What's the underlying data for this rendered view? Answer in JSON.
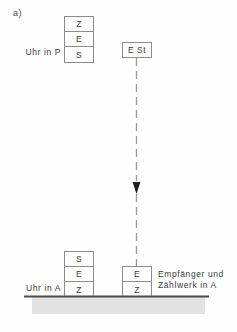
{
  "figure": {
    "panel_label": "a)",
    "colors": {
      "ink": "#3b3b3b",
      "box_stroke": "#8c8c8c",
      "ground_line": "#4a4a4a",
      "ground_fill": "#e2e2e2",
      "background": "#fefefe"
    }
  },
  "labels": {
    "clock_p": "Uhr in P",
    "clock_a": "Uhr in A",
    "receiver_line1": "Empfänger und",
    "receiver_line2": "Zählwerk in A"
  },
  "stacks": {
    "clock_p": {
      "name": "Uhr in P",
      "cells": [
        "Z",
        "E",
        "S"
      ]
    },
    "clock_a": {
      "name": "Uhr in A",
      "cells": [
        "S",
        "E",
        "Z"
      ]
    },
    "receiver_a": {
      "name": "Empfänger und Zählwerk in A",
      "cells": [
        "E",
        "Z"
      ]
    }
  },
  "signal_box": {
    "label": "E St"
  },
  "signal_path": {
    "direction": "downward",
    "style": "dashed",
    "from_label": "E St",
    "to_label": "Empfänger und Zählwerk in A"
  },
  "ground": {
    "label": ""
  }
}
